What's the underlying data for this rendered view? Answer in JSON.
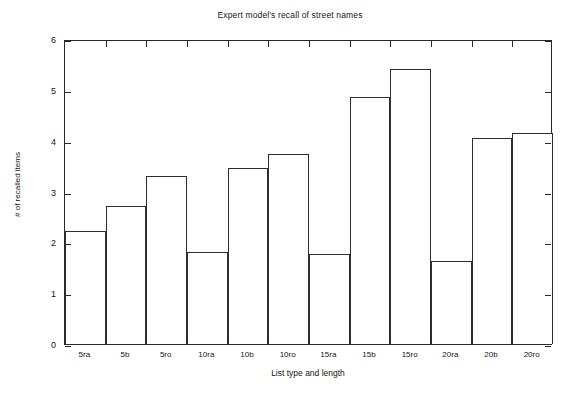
{
  "chart_data": {
    "type": "bar",
    "title": "Expert model's recall of street names",
    "xlabel": "List type and length",
    "ylabel": "# of recalled items",
    "categories": [
      "5ra",
      "5b",
      "5ro",
      "10ra",
      "10b",
      "10ro",
      "15ra",
      "15b",
      "15ro",
      "20ra",
      "20b",
      "20ro"
    ],
    "values": [
      2.22,
      2.72,
      3.31,
      1.81,
      3.47,
      3.73,
      1.78,
      4.86,
      5.41,
      1.63,
      4.05,
      4.15
    ],
    "ylim": [
      0,
      6
    ],
    "yticks": [
      0,
      1,
      2,
      3,
      4,
      5,
      6
    ],
    "ytick_labels": [
      "0",
      "1",
      "2",
      "3",
      "4",
      "5",
      "6"
    ],
    "grid": false,
    "legend": null,
    "bar_fill": "#ffffff",
    "bar_edge": "#2e2e2e",
    "axis_color": "#2a2a2a",
    "background": "#ffffff"
  }
}
